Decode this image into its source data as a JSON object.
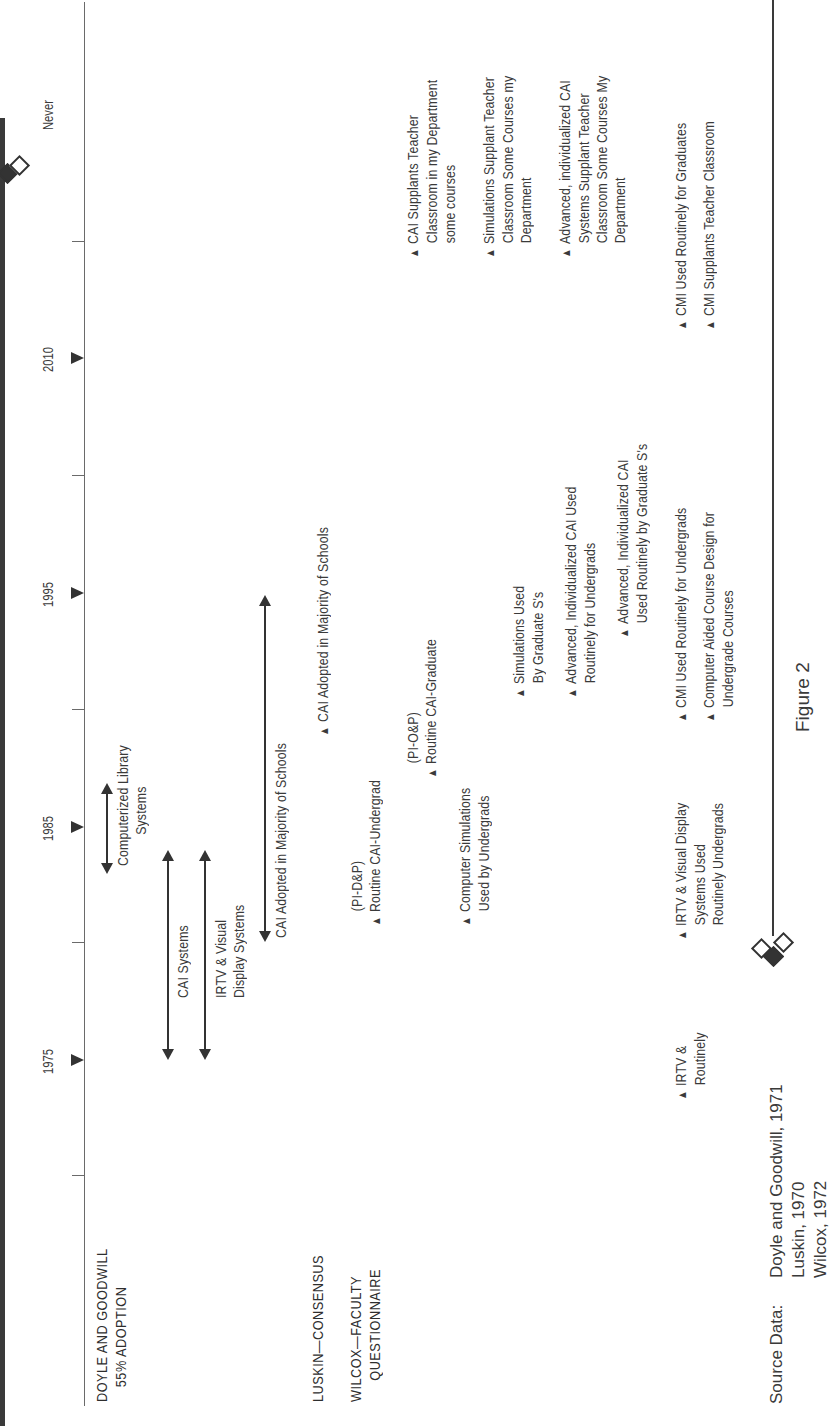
{
  "figure": {
    "caption": "Figure 2",
    "orientation": "rotated 90 degrees counterclockwise"
  },
  "axis": {
    "ticks": [
      {
        "label": "1975",
        "type": "major"
      },
      {
        "label": "1985",
        "type": "major"
      },
      {
        "label": "1995",
        "type": "major"
      },
      {
        "label": "2010",
        "type": "major"
      },
      {
        "label": "Never",
        "type": "label-only"
      }
    ]
  },
  "rows": {
    "doyle": {
      "label_line1": "DOYLE AND GOODWILL",
      "label_line2": "55% ADOPTION",
      "ranges": [
        {
          "label_line1": "Computerized Library",
          "label_line2": "Systems"
        },
        {
          "label_line1": "CAI Systems"
        },
        {
          "label_line1": "IRTV & Visual",
          "label_line2": "Display Systems"
        },
        {
          "label_line1": "CAI Adopted in Majority of Schools"
        }
      ]
    },
    "luskin": {
      "label": "LUSKIN—CONSENSUS",
      "events": [
        {
          "text": "CAI Adopted in Majority of Schools"
        }
      ]
    },
    "wilcox": {
      "label_line1": "WILCOX—FACULTY",
      "label_line2": "QUESTIONNAIRE",
      "events": [
        {
          "pre": "(PI-D&P)",
          "text": "Routine CAI-Undergrad"
        },
        {
          "pre": "(PI-O&P)",
          "text": "Routine CAI-Graduate"
        },
        {
          "line1": "Computer Simulations",
          "line2": "Used by Undergrads"
        },
        {
          "line1": "Simulations Used",
          "line2": "By Graduate S's"
        },
        {
          "line1": "Advanced, Individualized CAI Used",
          "line2": "Routinely for Undergrads"
        },
        {
          "line1": "Advanced, Individualized CAI",
          "line2": "Used Routinely by Graduate S's"
        },
        {
          "line1": "CAI Supplants Teacher",
          "line2": "Classroom in my Department",
          "line3": "some courses"
        },
        {
          "line1": "Simulations Supplant Teacher",
          "line2": "Classroom Some Courses my",
          "line3": "Department"
        },
        {
          "line1": "Advanced, individualized CAI",
          "line2": "Systems Supplant Teacher",
          "line3": "Classroom Some Courses My",
          "line4": "Department"
        },
        {
          "line1": "IRTV &",
          "line2": "Routinely"
        },
        {
          "line1": "IRTV & Visual Display",
          "line2": "Systems Used",
          "line3": "Routinely Undergrads"
        },
        {
          "line1": "CMI Used Routinely for Undergrads"
        },
        {
          "line1": "Computer Aided Course Design for",
          "line2": "Undergrade Courses"
        },
        {
          "line1": "CMI Used Routinely for Graduates"
        },
        {
          "line1": "CMI Supplants Teacher Classroom"
        }
      ]
    }
  },
  "source": {
    "label": "Source Data:",
    "lines": [
      "Doyle and Goodwill, 1971",
      "Luskin, 1970",
      "Wilcox, 1972"
    ]
  },
  "colors": {
    "ink": "#333333",
    "text": "#3a3a3a",
    "background": "#ffffff"
  }
}
